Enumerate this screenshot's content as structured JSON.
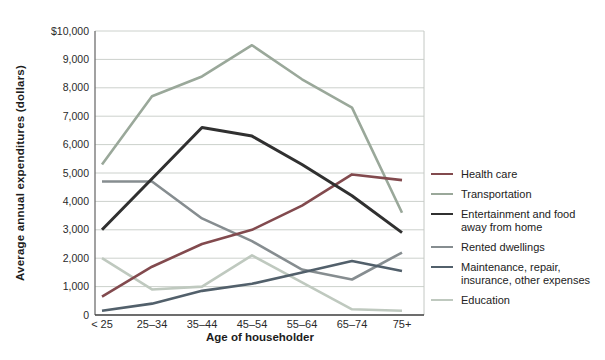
{
  "chart_data": {
    "type": "line",
    "title": "",
    "xlabel": "Age of householder",
    "ylabel": "Average annual expenditures (dollars)",
    "categories": [
      "< 25",
      "25–34",
      "35–44",
      "45–54",
      "55–64",
      "65–74",
      "75+"
    ],
    "ylim": [
      0,
      10000
    ],
    "ytick_interval": 1000,
    "ytick_labels_top_to_bottom": [
      "$10,000",
      "9,000",
      "8,000",
      "7,000",
      "6,000",
      "5,000",
      "4,000",
      "3,000",
      "2,000",
      "1,000",
      "0"
    ],
    "grid": true,
    "legend_position": "right",
    "series": [
      {
        "name": "Health care",
        "legend_label": "Health care",
        "color": "#824a4e",
        "values": [
          650,
          1700,
          2500,
          3000,
          3850,
          4950,
          4750
        ]
      },
      {
        "name": "Transportation",
        "legend_label": "Transportation",
        "color": "#9aa89a",
        "values": [
          5300,
          7700,
          8400,
          9500,
          8300,
          7300,
          3600
        ]
      },
      {
        "name": "Entertainment and food away from home",
        "legend_label": "Entertainment and food\naway from home",
        "color": "#303030",
        "values": [
          3000,
          4800,
          6600,
          6300,
          5300,
          4200,
          2900
        ]
      },
      {
        "name": "Rented dwellings",
        "legend_label": "Rented dwellings",
        "color": "#868d90",
        "values": [
          4700,
          4700,
          3400,
          2600,
          1600,
          1250,
          2200
        ]
      },
      {
        "name": "Maintenance, repair, insurance, other expenses",
        "legend_label": "Maintenance, repair,\ninsurance, other expenses",
        "color": "#52606b",
        "values": [
          150,
          400,
          850,
          1100,
          1500,
          1900,
          1550
        ]
      },
      {
        "name": "Education",
        "legend_label": "Education",
        "color": "#bfc9bf",
        "values": [
          2000,
          900,
          1000,
          2100,
          1150,
          200,
          150
        ]
      }
    ],
    "draw_order": [
      5,
      1,
      3,
      4,
      0,
      2
    ],
    "colors": {
      "gridline": "#ccd1cc",
      "plot_border_right": "#c4c8c4",
      "axis_left": "#6f6f6f",
      "axis_bottom": "#3c3c3c",
      "tick_text": "#2a2a2a"
    }
  }
}
